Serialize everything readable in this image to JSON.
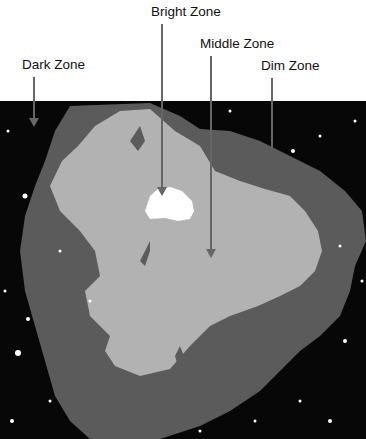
{
  "figure": {
    "labels": [
      {
        "id": "bright",
        "text": "Bright Zone"
      },
      {
        "id": "middle",
        "text": "Middle Zone"
      },
      {
        "id": "dark",
        "text": "Dark Zone"
      },
      {
        "id": "dim",
        "text": "Dim Zone"
      }
    ],
    "colors": {
      "dark": "#070707",
      "dim": "#5b5b5b",
      "middle": "#b2b2b2",
      "bright": "#ffffff",
      "arrow": "#666666"
    }
  }
}
